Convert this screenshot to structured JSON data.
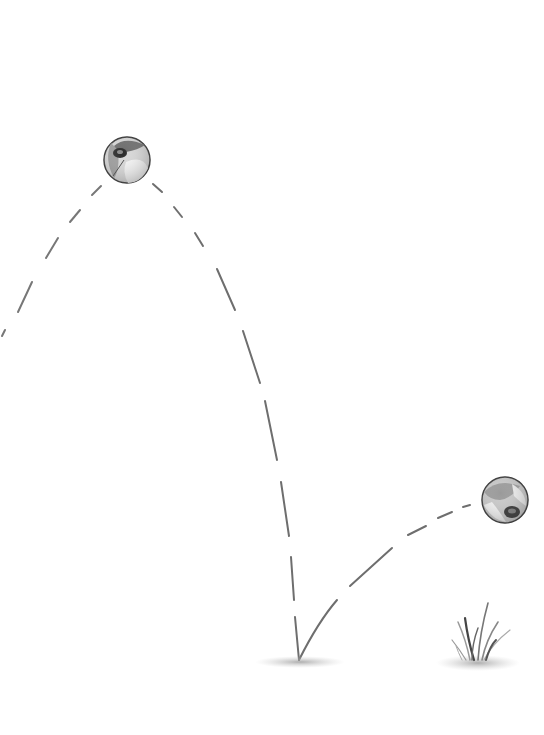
{
  "scene": {
    "description": "Pencil illustration of a beach ball bouncing along a dashed trajectory, hitting the ground and bouncing up toward a tuft of grass",
    "background": "#ffffff",
    "stroke_color": "#6a6a6a",
    "balls": [
      {
        "name": "ball-apex",
        "cx": 127,
        "cy": 160,
        "r": 23
      },
      {
        "name": "ball-rebound",
        "cx": 505,
        "cy": 500,
        "r": 23
      }
    ],
    "ground_marks": [
      {
        "name": "impact-shadow",
        "cx": 300,
        "cy": 662
      },
      {
        "name": "grass-shadow",
        "cx": 478,
        "cy": 662
      }
    ]
  }
}
